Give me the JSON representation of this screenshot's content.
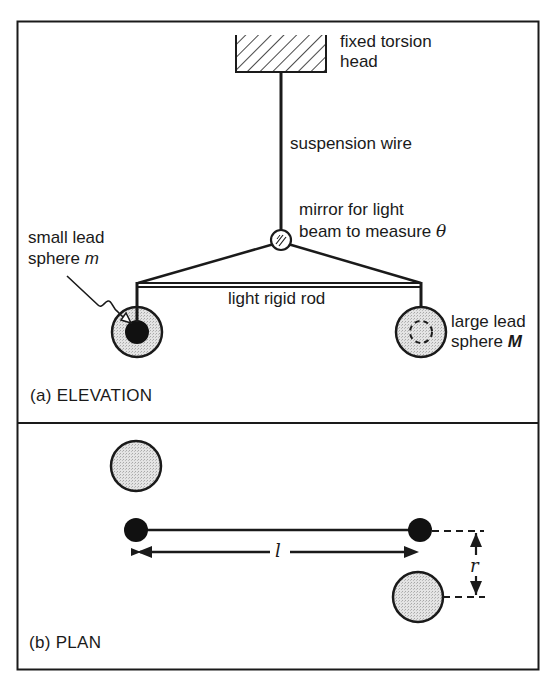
{
  "figure": {
    "elevation": {
      "caption": "(a)  ELEVATION",
      "labels": {
        "torsion_head_line1": "fixed torsion",
        "torsion_head_line2": "head",
        "suspension_wire": "suspension wire",
        "mirror_line1": "mirror for light",
        "mirror_line2_prefix": "beam to measure ",
        "mirror_symbol": "θ",
        "small_sphere_line1": "small lead",
        "small_sphere_line2_prefix": "sphere ",
        "small_sphere_symbol": "m",
        "rod": "light rigid rod",
        "large_sphere_line1": "large lead",
        "large_sphere_line2_prefix": "sphere ",
        "large_sphere_symbol": "M"
      }
    },
    "plan": {
      "caption": "(b)  PLAN",
      "labels": {
        "length_symbol": "l",
        "separation_symbol": "r"
      }
    }
  },
  "colors": {
    "ink": "#1a1a1a",
    "sphere_fill": "#d9d9d9",
    "background": "#ffffff"
  }
}
